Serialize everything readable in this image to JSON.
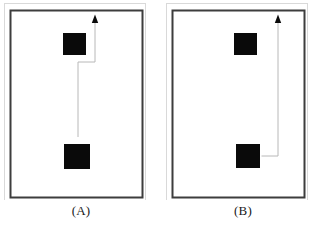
{
  "figure": {
    "title": "",
    "background_color": "#ffffff",
    "width": 324,
    "height": 230,
    "panel_count": 2
  },
  "style": {
    "frame_outer_color": "#d9d9d9",
    "frame_inner_color": "#3d3d3d",
    "frame_inner_width": 2,
    "frame_outer_width": 1,
    "obstacle_color": "#0a0a0a",
    "obstacle_border_color": "#ffffff",
    "path_color": "#b8b8b8",
    "path_width": 1,
    "arrow_color": "#0a0a0a",
    "label_color": "#1a1a1a"
  },
  "panels": [
    {
      "id": "a",
      "label": "(A)",
      "frame": {
        "x": 10,
        "y": 10,
        "width": 132,
        "height": 187
      },
      "obstacles": [
        {
          "name": "upper-obstacle",
          "x": 63,
          "y": 33,
          "width": 23,
          "height": 22
        },
        {
          "name": "lower-obstacle",
          "x": 64,
          "y": 144,
          "width": 26,
          "height": 25
        }
      ],
      "path": {
        "name": "zigzag-path",
        "description": "rises from above lower obstacle, jogs right past upper obstacle, exits top",
        "points": [
          {
            "x": 78,
            "y": 137
          },
          {
            "x": 78,
            "y": 62
          },
          {
            "x": 95,
            "y": 62
          },
          {
            "x": 95,
            "y": 20
          }
        ],
        "arrow_at": {
          "x": 95,
          "y": 18
        },
        "arrow_direction": "up"
      }
    },
    {
      "id": "b",
      "label": "(B)",
      "frame": {
        "x": 10,
        "y": 10,
        "width": 132,
        "height": 187
      },
      "obstacles": [
        {
          "name": "upper-obstacle",
          "x": 72,
          "y": 33,
          "width": 23,
          "height": 22
        },
        {
          "name": "lower-obstacle",
          "x": 74,
          "y": 144,
          "width": 24,
          "height": 24
        }
      ],
      "path": {
        "name": "right-detour-path",
        "description": "exits right side of lower obstacle, turns up at far right, exits top",
        "points": [
          {
            "x": 98,
            "y": 156
          },
          {
            "x": 116,
            "y": 156
          },
          {
            "x": 116,
            "y": 20
          }
        ],
        "arrow_at": {
          "x": 116,
          "y": 18
        },
        "arrow_direction": "up"
      }
    }
  ]
}
